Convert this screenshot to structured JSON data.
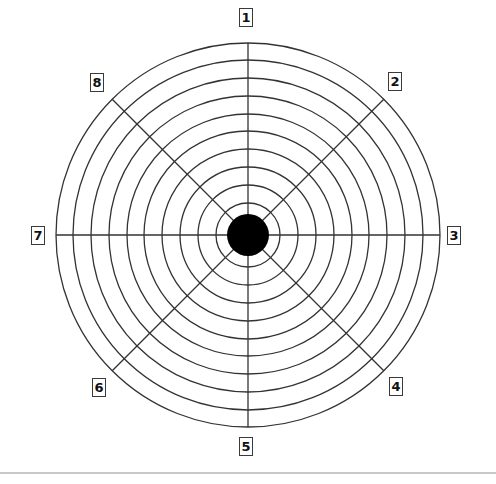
{
  "diagram": {
    "center": {
      "x": 248,
      "y": 235
    },
    "center_disc_radius": 21,
    "ring_radii": [
      32,
      50,
      68,
      86,
      104,
      121,
      139,
      157,
      175,
      192
    ],
    "spoke_count": 8,
    "stroke_color": "#333333",
    "disc_color": "#000000",
    "labels": [
      {
        "text": "1",
        "x": 239,
        "y": 8
      },
      {
        "text": "2",
        "x": 388,
        "y": 72
      },
      {
        "text": "3",
        "x": 447,
        "y": 226
      },
      {
        "text": "4",
        "x": 389,
        "y": 377
      },
      {
        "text": "5",
        "x": 239,
        "y": 437
      },
      {
        "text": "6",
        "x": 92,
        "y": 378
      },
      {
        "text": "7",
        "x": 31,
        "y": 226
      },
      {
        "text": "8",
        "x": 90,
        "y": 73
      }
    ]
  }
}
